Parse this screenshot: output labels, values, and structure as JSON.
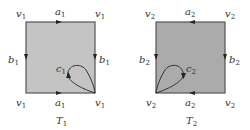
{
  "figures": [
    {
      "id": "T1",
      "title": {
        "main": "T",
        "sub": "1"
      },
      "fill": "#c4c4c4",
      "stroke": "#555555",
      "corners": {
        "main": "v",
        "sub": "1"
      },
      "top_edge": {
        "main": "a",
        "sub": "1",
        "arrow": "right"
      },
      "bottom_edge": {
        "main": "a",
        "sub": "1",
        "arrow": "right"
      },
      "left_edge": {
        "main": "b",
        "sub": "1",
        "arrow": "down"
      },
      "right_edge": {
        "main": "b",
        "sub": "1",
        "arrow": "down"
      },
      "loop": {
        "main": "c",
        "sub": "1",
        "anchor": "bottom-right corner",
        "arrow": "up"
      }
    },
    {
      "id": "T2",
      "title": {
        "main": "T",
        "sub": "2"
      },
      "fill": "#ababab",
      "stroke": "#555555",
      "corners": {
        "main": "v",
        "sub": "2"
      },
      "top_edge": {
        "main": "a",
        "sub": "2",
        "arrow": "left"
      },
      "bottom_edge": {
        "main": "a",
        "sub": "2",
        "arrow": "left"
      },
      "left_edge": {
        "main": "b",
        "sub": "2",
        "arrow": "down"
      },
      "right_edge": {
        "main": "b",
        "sub": "2",
        "arrow": "down"
      },
      "loop": {
        "main": "c",
        "sub": "2",
        "anchor": "bottom-left corner",
        "arrow": "down"
      }
    }
  ]
}
